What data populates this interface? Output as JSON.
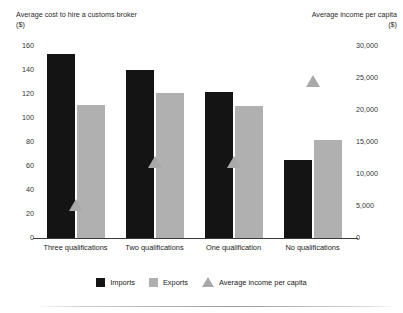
{
  "chart_data": {
    "type": "bar",
    "title": "",
    "subtitle": "",
    "categories": [
      "Three qualifications",
      "Two  qualifications",
      "One  qualification",
      "No qualifications"
    ],
    "series": [
      {
        "name": "Imports",
        "type": "bar",
        "axis": "left",
        "color": "#141414",
        "values": [
          153,
          140,
          122,
          65
        ]
      },
      {
        "name": "Exports",
        "type": "bar",
        "axis": "left",
        "color": "#b0b0b0",
        "values": [
          111,
          121,
          110,
          82
        ]
      },
      {
        "name": "Average income per capita",
        "type": "scatter",
        "marker": "triangle",
        "axis": "right",
        "color": "#a9a9a9",
        "values": [
          5200,
          11800,
          11800,
          24500
        ]
      }
    ],
    "xlabel": "",
    "ylabel": "Average cost to hire a customs broker\n($)",
    "y2label": "Average income per capita\n($)",
    "ylim": [
      0,
      160
    ],
    "y2lim": [
      0,
      30000
    ],
    "yticks": [
      "0",
      "20",
      "40",
      "60",
      "80",
      "100",
      "120",
      "140",
      "160"
    ],
    "ytick_values": [
      0,
      20,
      40,
      60,
      80,
      100,
      120,
      140,
      160
    ],
    "y2ticks": [
      "0",
      "5,000",
      "10,000",
      "15,000",
      "20,000",
      "25,000",
      "30,000"
    ],
    "y2tick_values": [
      0,
      5000,
      10000,
      15000,
      20000,
      25000,
      30000
    ],
    "grid": false,
    "legend_position": "bottom",
    "legend": [
      "Imports",
      "Exports",
      "Average income per capita"
    ]
  },
  "axes": {
    "left_title": "Average cost to hire a customs broker\n($)",
    "right_title": "Average income per capita\n($)"
  }
}
